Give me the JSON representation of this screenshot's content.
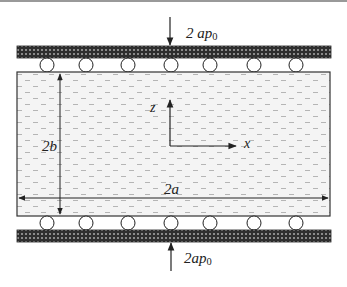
{
  "diagram": {
    "type": "physical-setup",
    "colors": {
      "plate": "#3a3a3a",
      "specimen_fill": "#f2f2f2",
      "dash": "#b8b8b8",
      "line": "#333333"
    },
    "top_load": {
      "label_main": "2 ap",
      "label_sub": "0",
      "direction": "down"
    },
    "bottom_load": {
      "label_main": "2ap",
      "label_sub": "0",
      "direction": "up"
    },
    "dimensions": {
      "height_label": "2b",
      "width_label": "2a"
    },
    "axes": {
      "vertical_label": "z",
      "horizontal_label": "x"
    },
    "rollers": {
      "top_count": 7,
      "bottom_count": 7
    }
  }
}
